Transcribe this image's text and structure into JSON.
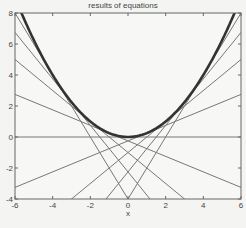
{
  "chart_data": {
    "type": "line",
    "title": "results of equations",
    "xlabel": "x",
    "ylabel": "",
    "xlim": [
      -6,
      6
    ],
    "ylim": [
      -4,
      8
    ],
    "xticks": [
      -6,
      -4,
      -2,
      0,
      2,
      4,
      6
    ],
    "yticks": [
      -4,
      -2,
      0,
      2,
      4,
      6,
      8
    ],
    "grid": false,
    "legend": null,
    "series": [
      {
        "name": "parabola y = x^2/4",
        "style": "thick",
        "color": "#333333",
        "equation": "y = x^2/4"
      },
      {
        "name": "tangent a=-4",
        "equation": "y = -2x - 4",
        "slope": -2,
        "intercept": -4
      },
      {
        "name": "tangent a=-3",
        "equation": "y = -1.5x - 2.25",
        "slope": -1.5,
        "intercept": -2.25
      },
      {
        "name": "tangent a=-2",
        "equation": "y = -x - 1",
        "slope": -1,
        "intercept": -1
      },
      {
        "name": "tangent a=-1",
        "equation": "y = -0.5x - 0.25",
        "slope": -0.5,
        "intercept": -0.25
      },
      {
        "name": "tangent a=0",
        "equation": "y = 0",
        "slope": 0,
        "intercept": 0
      },
      {
        "name": "tangent a=1",
        "equation": "y = 0.5x - 0.25",
        "slope": 0.5,
        "intercept": -0.25
      },
      {
        "name": "tangent a=2",
        "equation": "y = x - 1",
        "slope": 1,
        "intercept": -1
      },
      {
        "name": "tangent a=3",
        "equation": "y = 1.5x - 2.25",
        "slope": 1.5,
        "intercept": -2.25
      },
      {
        "name": "tangent a=4",
        "equation": "y = 2x - 4",
        "slope": 2,
        "intercept": -4
      }
    ]
  },
  "labels": {
    "title": "results of equations",
    "xlabel": "x"
  }
}
